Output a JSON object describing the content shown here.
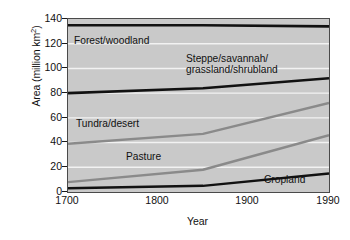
{
  "chart_data": {
    "type": "area",
    "title": "",
    "xlabel": "Year",
    "ylabel": "Area (million km²)",
    "ylabel_main": "Area (million km",
    "ylabel_sup": "2",
    "ylabel_close": ")",
    "xlim": [
      1700,
      1990
    ],
    "ylim": [
      0,
      140
    ],
    "grid": "horizontal-white",
    "legend": "inline-annotations",
    "x": [
      1700,
      1850,
      1990
    ],
    "xticks": [
      "1700",
      "1800",
      "1900",
      "1990"
    ],
    "xtick_values": [
      1700,
      1800,
      1900,
      1990
    ],
    "yticks": [
      "0",
      "20",
      "40",
      "60",
      "80",
      "100",
      "120",
      "140"
    ],
    "ytick_values": [
      0,
      20,
      40,
      60,
      80,
      100,
      120,
      140
    ],
    "series": [
      {
        "name": "Forest/woodland",
        "label": "Forest/woodland",
        "color": "#111111",
        "width": 2.6,
        "values": [
          135,
          135,
          134
        ]
      },
      {
        "name": "Steppe/savannah/grassland/shrubland",
        "label_line1": "Steppe/savannah/",
        "label_line2": "grassland/shrubland",
        "color": "#111111",
        "width": 2.6,
        "values": [
          80,
          84,
          92
        ]
      },
      {
        "name": "Tundra/desert",
        "label": "Tundra/desert",
        "color": "#8a8a8a",
        "width": 2.4,
        "values": [
          39,
          47,
          72
        ]
      },
      {
        "name": "Pasture",
        "label": "Pasture",
        "color": "#8a8a8a",
        "width": 2.4,
        "values": [
          8,
          18,
          46
        ]
      },
      {
        "name": "Cropland",
        "label": "Cropland",
        "color": "#111111",
        "width": 2.4,
        "values": [
          3,
          5,
          15
        ]
      }
    ],
    "colors": {
      "plot_background": "#c9c9c9",
      "gridline": "#f2f2f2",
      "frame": "#4a4a4a",
      "text": "#111111",
      "dark_series": "#111111",
      "gray_series": "#8a8a8a",
      "page_background": "#ffffff"
    }
  }
}
